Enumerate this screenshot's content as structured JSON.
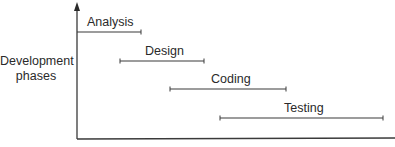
{
  "diagram": {
    "type": "waterfall-phase-timeline",
    "y_axis_label_line1": "Development",
    "y_axis_label_line2": "phases",
    "x_axis_label": "",
    "phases": [
      {
        "label": "Analysis",
        "start_x": 77,
        "end_x": 141,
        "y": 32,
        "label_x": 87,
        "label_y": 16
      },
      {
        "label": "Design",
        "start_x": 120,
        "end_x": 204,
        "y": 61,
        "label_x": 145,
        "label_y": 45
      },
      {
        "label": "Coding",
        "start_x": 170,
        "end_x": 286,
        "y": 89,
        "label_x": 211,
        "label_y": 73
      },
      {
        "label": "Testing",
        "start_x": 220,
        "end_x": 383,
        "y": 118,
        "label_x": 284,
        "label_y": 102
      }
    ],
    "colors": {
      "line": "#3a3a3a",
      "text": "#2a2a2a",
      "background": "#ffffff"
    }
  }
}
